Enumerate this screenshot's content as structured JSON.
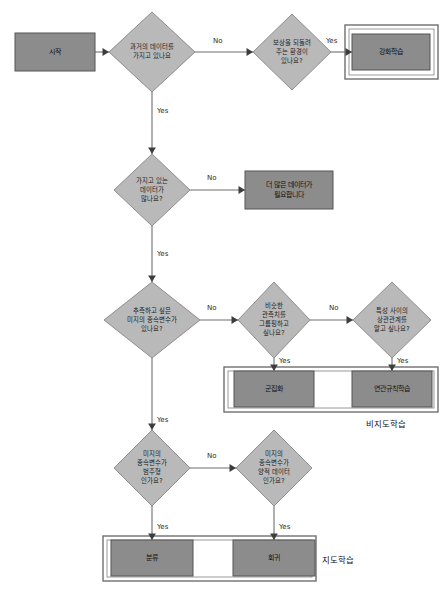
{
  "canvas": {
    "width": 444,
    "height": 593,
    "background": "#ffffff"
  },
  "colors": {
    "box_fill": "#8c8c8c",
    "box_stroke": "#555555",
    "diamond_fill": "#b9b9b9",
    "diamond_stroke": "#8f8f8f",
    "edge": "#6f6f6f",
    "group_outer": "#6f6f6f",
    "group_inner": "#9a9a9a",
    "text": "#1c1c1c"
  },
  "chart_data": {
    "type": "diagram",
    "nodes": [
      {
        "id": "start",
        "shape": "box",
        "label": "시작",
        "lines": [
          "시작"
        ],
        "cx": 55,
        "cy": 52,
        "w": 80,
        "h": 38
      },
      {
        "id": "d_history",
        "shape": "diamond",
        "label": "과거의 데이터를 가지고 있나요",
        "lines": [
          "과거의 데이터를",
          "가지고 있나요"
        ],
        "cx": 152,
        "cy": 52,
        "w": 86,
        "h": 80
      },
      {
        "id": "d_reward",
        "shape": "diamond",
        "label": "보상을 되돌려 주는 환경이 있나요?",
        "lines": [
          "보상을 되돌려",
          "주는 환경이",
          "있나요?"
        ],
        "cx": 292,
        "cy": 52,
        "w": 78,
        "h": 76
      },
      {
        "id": "b_rl",
        "shape": "box",
        "label": "강화학습",
        "lines": [
          "강화학습"
        ],
        "cx": 391,
        "cy": 52,
        "w": 78,
        "h": 36
      },
      {
        "id": "d_enough",
        "shape": "diamond",
        "label": "가지고 있는 데이터가 많나요?",
        "lines": [
          "가지고 있는",
          "데이터가",
          "많나요?"
        ],
        "cx": 152,
        "cy": 190,
        "w": 76,
        "h": 72
      },
      {
        "id": "b_moredata",
        "shape": "box",
        "label": "더 많은 데이터가 필요합니다",
        "lines": [
          "더 많은 데이터가",
          "필요합니다"
        ],
        "cx": 289,
        "cy": 190,
        "w": 88,
        "h": 38
      },
      {
        "id": "d_target",
        "shape": "diamond",
        "label": "추측하고 싶은 미지의 종속변수가 있나요?",
        "lines": [
          "추측하고 싶은",
          "미지의 종속변수가",
          "있나요?"
        ],
        "cx": 152,
        "cy": 320,
        "w": 96,
        "h": 76
      },
      {
        "id": "d_group",
        "shape": "diamond",
        "label": "비슷한 관측치를 그룹핑하고 싶나요?",
        "lines": [
          "비슷한",
          "관측치를",
          "그룹핑하고",
          "싶나요?"
        ],
        "cx": 274,
        "cy": 320,
        "w": 72,
        "h": 76
      },
      {
        "id": "d_corr",
        "shape": "diamond",
        "label": "특성 사이의 상관관계를 알고 싶나요?",
        "lines": [
          "특성 사이의",
          "상관관계를",
          "알고 싶나요?"
        ],
        "cx": 392,
        "cy": 320,
        "w": 78,
        "h": 76
      },
      {
        "id": "b_cluster",
        "shape": "box",
        "label": "군집화",
        "lines": [
          "군집화"
        ],
        "cx": 274,
        "cy": 389,
        "w": 80,
        "h": 36
      },
      {
        "id": "b_assoc",
        "shape": "box",
        "label": "연관규칙학습",
        "lines": [
          "연관규칙학습"
        ],
        "cx": 392,
        "cy": 389,
        "w": 80,
        "h": 36
      },
      {
        "id": "d_categor",
        "shape": "diamond",
        "label": "미지의 종속변수가 범주형 인가요?",
        "lines": [
          "미지의",
          "종속변수가",
          "범주형",
          "인가요?"
        ],
        "cx": 152,
        "cy": 468,
        "w": 76,
        "h": 76
      },
      {
        "id": "d_quant",
        "shape": "diamond",
        "label": "미지의 종속변수가 양적 데이터 인가요?",
        "lines": [
          "미지의",
          "종속변수가",
          "양적 데이터",
          "인가요?"
        ],
        "cx": 274,
        "cy": 468,
        "w": 76,
        "h": 76
      },
      {
        "id": "b_class",
        "shape": "box",
        "label": "분류",
        "lines": [
          "분류"
        ],
        "cx": 152,
        "cy": 558,
        "w": 82,
        "h": 36
      },
      {
        "id": "b_regress",
        "shape": "box",
        "label": "회귀",
        "lines": [
          "회귀"
        ],
        "cx": 274,
        "cy": 558,
        "w": 82,
        "h": 36
      }
    ],
    "edges": [
      {
        "id": "e1",
        "from": "start",
        "to": "d_history",
        "label": "",
        "label_x": 0,
        "label_y": 0
      },
      {
        "id": "e2",
        "from": "d_history",
        "to": "d_reward",
        "label": "No",
        "label_x": 213,
        "label_y": 41
      },
      {
        "id": "e3",
        "from": "d_reward",
        "to": "b_rl",
        "label": "Yes",
        "label_x": 326,
        "label_y": 41
      },
      {
        "id": "e4",
        "from": "d_history",
        "to": "d_enough",
        "label": "Yes",
        "label_x": 157,
        "label_y": 111
      },
      {
        "id": "e5",
        "from": "d_enough",
        "to": "b_moredata",
        "label": "No",
        "label_x": 207,
        "label_y": 178
      },
      {
        "id": "e6",
        "from": "d_enough",
        "to": "d_target",
        "label": "Yes",
        "label_x": 157,
        "label_y": 254
      },
      {
        "id": "e7",
        "from": "d_target",
        "to": "d_group",
        "label": "No",
        "label_x": 207,
        "label_y": 308
      },
      {
        "id": "e8",
        "from": "d_group",
        "to": "d_corr",
        "label": "No",
        "label_x": 329,
        "label_y": 308
      },
      {
        "id": "e9",
        "from": "d_group",
        "to": "b_cluster",
        "label": "Yes",
        "label_x": 279,
        "label_y": 361
      },
      {
        "id": "e10",
        "from": "d_corr",
        "to": "b_assoc",
        "label": "Yes",
        "label_x": 397,
        "label_y": 361
      },
      {
        "id": "e11",
        "from": "d_target",
        "to": "d_categor",
        "label": "Yes",
        "label_x": 157,
        "label_y": 420
      },
      {
        "id": "e12",
        "from": "d_categor",
        "to": "d_quant",
        "label": "No",
        "label_x": 207,
        "label_y": 456
      },
      {
        "id": "e13",
        "from": "d_categor",
        "to": "b_class",
        "label": "Yes",
        "label_x": 157,
        "label_y": 527
      },
      {
        "id": "e14",
        "from": "d_quant",
        "to": "b_regress",
        "label": "Yes",
        "label_x": 279,
        "label_y": 527
      }
    ],
    "groups": [
      {
        "id": "g_rl",
        "caption": "",
        "x": 345,
        "y": 25,
        "w": 93,
        "h": 54,
        "caption_x": 0,
        "caption_y": 0
      },
      {
        "id": "g_unsupervised",
        "caption": "비지도학습",
        "x": 224,
        "y": 367,
        "w": 214,
        "h": 45,
        "caption_x": 366,
        "caption_y": 424
      },
      {
        "id": "g_supervised",
        "caption": "지도학습",
        "x": 103,
        "y": 536,
        "w": 213,
        "h": 45,
        "caption_x": 322,
        "caption_y": 560
      }
    ]
  }
}
